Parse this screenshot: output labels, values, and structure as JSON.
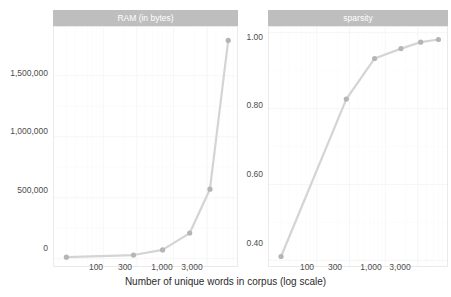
{
  "figure": {
    "background_color": "#ffffff",
    "strip_background_color": "#bebebe",
    "strip_text_color": "#ffffff",
    "series_color": "#d4d4d4",
    "point_color": "#b5b5b5",
    "gridline_color": "#f6f6f6",
    "axis_text_color": "#4d4d4d",
    "axis_title_color": "#2b2b2b",
    "xlabel": "Number of unique words in corpus (log scale)"
  },
  "chart_data": [
    {
      "type": "line",
      "title": "RAM (in bytes)",
      "panel": "left",
      "xlabel": "Number of unique words in corpus (log scale)",
      "ylabel": "",
      "xscale": "log",
      "xlim": [
        20,
        8000
      ],
      "ylim": [
        -60000,
        1900000
      ],
      "grid": true,
      "legend": "none",
      "x": [
        30,
        270,
        700,
        1700,
        3300,
        6000
      ],
      "values": [
        12000,
        30000,
        72000,
        210000,
        570000,
        1790000
      ],
      "xticks": [
        100,
        300,
        1000,
        3000
      ],
      "xticklabels": [
        "100",
        "300",
        "1,000",
        "3,000"
      ],
      "yticks": [
        0,
        500000,
        1000000,
        1500000
      ],
      "yticklabels": [
        "0",
        "500,000",
        "1,000,000",
        "1,500,000"
      ]
    },
    {
      "type": "line",
      "title": "sparsity",
      "panel": "right",
      "xlabel": "Number of unique words in corpus (log scale)",
      "ylabel": "",
      "xscale": "log",
      "xlim": [
        20,
        8000
      ],
      "ylim": [
        0.385,
        1.015
      ],
      "grid": true,
      "legend": "none",
      "x": [
        30,
        270,
        700,
        1700,
        3300,
        6000
      ],
      "values": [
        0.41,
        0.825,
        0.932,
        0.958,
        0.975,
        0.982
      ],
      "xticks": [
        100,
        300,
        1000,
        3000
      ],
      "xticklabels": [
        "100",
        "300",
        "1,000",
        "3,000"
      ],
      "yticks": [
        0.4,
        0.6,
        0.8,
        1.0
      ],
      "yticklabels": [
        "0.40",
        "0.60",
        "0.80",
        "1.00"
      ]
    }
  ],
  "panels": {
    "left": {
      "strip_label": "RAM (in bytes)",
      "ytick_labels": [
        "1,500,000",
        "1,000,000",
        "500,000",
        "0"
      ],
      "xtick_labels": [
        "100",
        "300",
        "1,000",
        "3,000"
      ]
    },
    "right": {
      "strip_label": "sparsity",
      "ytick_labels": [
        "1.00",
        "0.80",
        "0.60",
        "0.40"
      ],
      "xtick_labels": [
        "100",
        "300",
        "1,000",
        "3,000"
      ]
    }
  }
}
